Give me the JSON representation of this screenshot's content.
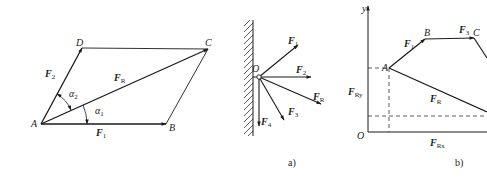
{
  "figure_left": {
    "points": {
      "A": "A",
      "B": "B",
      "C": "C",
      "D": "D"
    },
    "forces": {
      "F1": {
        "base": "F",
        "sub": "1"
      },
      "F2": {
        "base": "F",
        "sub": "2"
      },
      "FR": {
        "base": "F",
        "sub": "R"
      }
    },
    "angles": {
      "alpha1": {
        "base": "α",
        "sub": "1"
      },
      "alpha2": {
        "base": "α",
        "sub": "2"
      }
    }
  },
  "figure_a": {
    "caption": "a)",
    "origin": "O",
    "forces": {
      "F1": {
        "base": "F",
        "sub": "1"
      },
      "F2": {
        "base": "F",
        "sub": "2"
      },
      "FR": {
        "base": "F",
        "sub": "R"
      },
      "F3": {
        "base": "F",
        "sub": "3"
      },
      "F4": {
        "base": "F",
        "sub": "4"
      }
    }
  },
  "figure_b": {
    "caption": "b)",
    "axis_y": "y",
    "origin": "O",
    "points": {
      "A": "A",
      "B": "B",
      "C": "C"
    },
    "forces": {
      "F1": {
        "base": "F",
        "sub": "1"
      },
      "F3": {
        "base": "F",
        "sub": "3"
      },
      "FR": {
        "base": "F",
        "sub": "R"
      },
      "FRy": {
        "base": "F",
        "sub": "Ry"
      },
      "FRx": {
        "base": "F",
        "sub": "Rx"
      }
    }
  },
  "colors": {
    "line": "#1a1a1a",
    "background": "#ffffff"
  }
}
